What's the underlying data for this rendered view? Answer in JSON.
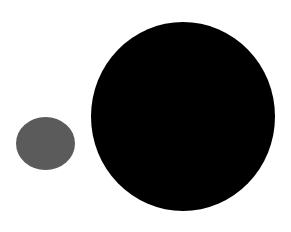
{
  "canvas": {
    "width": 291,
    "height": 232,
    "background": "#ffffff"
  },
  "shapes": [
    {
      "name": "small-gray-circle",
      "type": "circle",
      "cx": 45.5,
      "cy": 143,
      "width": 59,
      "height": 53,
      "color": "#5b5b5b"
    },
    {
      "name": "large-black-circle",
      "type": "circle",
      "cx": 183,
      "cy": 116.5,
      "width": 184,
      "height": 189,
      "color": "#000000"
    }
  ]
}
